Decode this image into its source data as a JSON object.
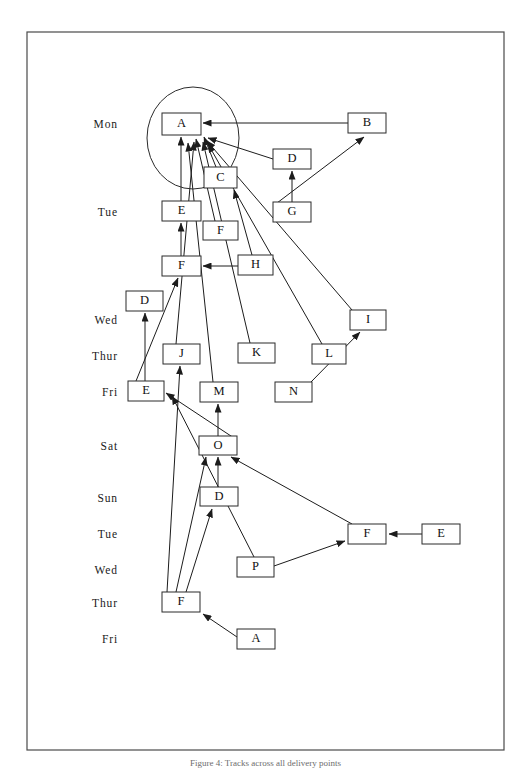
{
  "figure": {
    "caption": "Figure 4: Tracks across all delivery points",
    "background_color": "#ffffff",
    "line_color": "#1c1c1c",
    "frame_color": "#4a4a4a",
    "node_fill": "#ffffff",
    "node_stroke": "#2b2b2b"
  },
  "frame": {
    "x": 27,
    "y": 32,
    "width": 477,
    "height": 718
  },
  "cluster": {
    "name": "highlight-ellipse",
    "cx": 193,
    "cy": 138,
    "rx": 46,
    "ry": 51
  },
  "day_axis": {
    "label_x": 118,
    "labels": [
      {
        "text": "Mon",
        "y": 128
      },
      {
        "text": "Tue",
        "y": 216
      },
      {
        "text": "Wed",
        "y": 324
      },
      {
        "text": "Thur",
        "y": 360
      },
      {
        "text": "Fri",
        "y": 396
      },
      {
        "text": "Sat",
        "y": 450
      },
      {
        "text": "Sun",
        "y": 502
      },
      {
        "text": "Tue",
        "y": 538
      },
      {
        "text": "Wed",
        "y": 574
      },
      {
        "text": "Thur",
        "y": 607
      },
      {
        "text": "Fri",
        "y": 643
      }
    ]
  },
  "nodes": [
    {
      "id": "n1",
      "label": "A",
      "x": 162,
      "y": 113,
      "w": 39,
      "h": 22
    },
    {
      "id": "n2",
      "label": "B",
      "x": 348,
      "y": 113,
      "w": 38,
      "h": 20
    },
    {
      "id": "n3",
      "label": "D",
      "x": 273,
      "y": 149,
      "w": 38,
      "h": 20
    },
    {
      "id": "n4",
      "label": "C",
      "x": 204,
      "y": 167,
      "w": 33,
      "h": 21
    },
    {
      "id": "n5",
      "label": "E",
      "x": 162,
      "y": 201,
      "w": 39,
      "h": 20
    },
    {
      "id": "n6",
      "label": "G",
      "x": 273,
      "y": 202,
      "w": 38,
      "h": 20
    },
    {
      "id": "n7",
      "label": "F",
      "x": 203,
      "y": 221,
      "w": 35,
      "h": 19
    },
    {
      "id": "n8",
      "label": "F",
      "x": 162,
      "y": 256,
      "w": 39,
      "h": 20
    },
    {
      "id": "n9",
      "label": "H",
      "x": 238,
      "y": 255,
      "w": 35,
      "h": 20
    },
    {
      "id": "n10",
      "label": "D",
      "x": 126,
      "y": 291,
      "w": 37,
      "h": 20
    },
    {
      "id": "n11",
      "label": "I",
      "x": 350,
      "y": 310,
      "w": 36,
      "h": 20
    },
    {
      "id": "n12",
      "label": "J",
      "x": 163,
      "y": 344,
      "w": 37,
      "h": 20
    },
    {
      "id": "n13",
      "label": "K",
      "x": 238,
      "y": 343,
      "w": 37,
      "h": 20
    },
    {
      "id": "n14",
      "label": "L",
      "x": 312,
      "y": 344,
      "w": 34,
      "h": 20
    },
    {
      "id": "n15",
      "label": "E",
      "x": 128,
      "y": 381,
      "w": 36,
      "h": 20
    },
    {
      "id": "n16",
      "label": "M",
      "x": 200,
      "y": 382,
      "w": 38,
      "h": 20
    },
    {
      "id": "n17",
      "label": "N",
      "x": 275,
      "y": 382,
      "w": 37,
      "h": 20
    },
    {
      "id": "n18",
      "label": "O",
      "x": 199,
      "y": 436,
      "w": 38,
      "h": 19
    },
    {
      "id": "n19",
      "label": "D",
      "x": 200,
      "y": 487,
      "w": 38,
      "h": 19
    },
    {
      "id": "n20",
      "label": "F",
      "x": 348,
      "y": 524,
      "w": 38,
      "h": 20
    },
    {
      "id": "n21",
      "label": "E",
      "x": 422,
      "y": 524,
      "w": 38,
      "h": 20
    },
    {
      "id": "n22",
      "label": "P",
      "x": 237,
      "y": 557,
      "w": 37,
      "h": 20
    },
    {
      "id": "n23",
      "label": "F",
      "x": 162,
      "y": 592,
      "w": 38,
      "h": 20
    },
    {
      "id": "n24",
      "label": "A",
      "x": 237,
      "y": 629,
      "w": 38,
      "h": 20
    }
  ],
  "edges": [
    {
      "from": "B",
      "to": "A",
      "x1": 348,
      "y1": 123,
      "x2": 203,
      "y2": 123
    },
    {
      "from": "D",
      "to": "A",
      "x1": 273,
      "y1": 159,
      "x2": 208,
      "y2": 138
    },
    {
      "from": "G",
      "to": "D",
      "x1": 292,
      "y1": 202,
      "x2": 292,
      "y2": 171
    },
    {
      "from": "G",
      "to": "B",
      "x1": 277,
      "y1": 203,
      "x2": 364,
      "y2": 137
    },
    {
      "from": "C",
      "to": "A",
      "x1": 216,
      "y1": 167,
      "x2": 204,
      "y2": 137
    },
    {
      "from": "E",
      "to": "A",
      "x1": 181,
      "y1": 201,
      "x2": 181,
      "y2": 137
    },
    {
      "from": "F",
      "to": "E",
      "x1": 181,
      "y1": 256,
      "x2": 181,
      "y2": 223
    },
    {
      "from": "F2",
      "to": "A",
      "x1": 215,
      "y1": 221,
      "x2": 196,
      "y2": 139
    },
    {
      "from": "H",
      "to": "F",
      "x1": 238,
      "y1": 266,
      "x2": 203,
      "y2": 266
    },
    {
      "from": "H",
      "to": "C",
      "x1": 252,
      "y1": 255,
      "x2": 234,
      "y2": 190
    },
    {
      "from": "I",
      "to": "A",
      "x1": 352,
      "y1": 310,
      "x2": 207,
      "y2": 141
    },
    {
      "from": "J",
      "to": "A",
      "x1": 176,
      "y1": 344,
      "x2": 194,
      "y2": 142
    },
    {
      "from": "K",
      "to": "A",
      "x1": 250,
      "y1": 343,
      "x2": 203,
      "y2": 142
    },
    {
      "from": "L",
      "to": "A",
      "x1": 322,
      "y1": 344,
      "x2": 208,
      "y2": 144
    },
    {
      "from": "M",
      "to": "A",
      "x1": 213,
      "y1": 382,
      "x2": 188,
      "y2": 143
    },
    {
      "from": "N",
      "to": "I",
      "x1": 311,
      "y1": 382,
      "x2": 360,
      "y2": 332
    },
    {
      "from": "E2",
      "to": "D",
      "x1": 145,
      "y1": 381,
      "x2": 145,
      "y2": 313
    },
    {
      "from": "E2",
      "to": "F",
      "x1": 136,
      "y1": 381,
      "x2": 178,
      "y2": 278
    },
    {
      "from": "O",
      "to": "M",
      "x1": 218,
      "y1": 436,
      "x2": 218,
      "y2": 404
    },
    {
      "from": "O",
      "to": "E2",
      "x1": 237,
      "y1": 440,
      "x2": 166,
      "y2": 393
    },
    {
      "from": "D2",
      "to": "O",
      "x1": 218,
      "y1": 487,
      "x2": 218,
      "y2": 457
    },
    {
      "from": "F3",
      "to": "O",
      "x1": 176,
      "y1": 592,
      "x2": 206,
      "y2": 457
    },
    {
      "from": "F3",
      "to": "D2",
      "x1": 186,
      "y1": 592,
      "x2": 212,
      "y2": 509
    },
    {
      "from": "F3",
      "to": "J",
      "x1": 167,
      "y1": 592,
      "x2": 180,
      "y2": 366
    },
    {
      "from": "F4",
      "to": "O",
      "x1": 352,
      "y1": 524,
      "x2": 231,
      "y2": 457
    },
    {
      "from": "E3",
      "to": "F4",
      "x1": 422,
      "y1": 534,
      "x2": 389,
      "y2": 534
    },
    {
      "from": "P",
      "to": "F4",
      "x1": 274,
      "y1": 566,
      "x2": 345,
      "y2": 541
    },
    {
      "from": "P",
      "to": "E2",
      "x1": 254,
      "y1": 557,
      "x2": 172,
      "y2": 396
    },
    {
      "from": "A2",
      "to": "F3",
      "x1": 237,
      "y1": 637,
      "x2": 203,
      "y2": 614
    }
  ]
}
